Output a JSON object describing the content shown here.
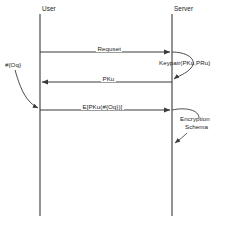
{
  "diagram": {
    "type": "uml-sequence-diagram",
    "title": "",
    "background_color": "#ffffff",
    "line_color": "#3a3a3a",
    "text_color": "#1c1c1c",
    "lifelines": [
      {
        "id": "user",
        "label": "User",
        "x": 40,
        "top": 14,
        "bottom": 216,
        "label_x": 42,
        "label_y": 6
      },
      {
        "id": "server",
        "label": "Server",
        "x": 172,
        "top": 14,
        "bottom": 216,
        "label_x": 174,
        "label_y": 6
      }
    ],
    "messages": [
      {
        "id": "request",
        "label": "Requset",
        "from": "user",
        "to": "server",
        "y": 52,
        "direction": "right",
        "label_x": 97,
        "label_y": 46
      },
      {
        "id": "public-key",
        "label": "PKu",
        "from": "server",
        "to": "user",
        "y": 82,
        "direction": "left",
        "label_x": 100,
        "label_y": 76
      },
      {
        "id": "encrypted-payload",
        "label": "E[PKu(#{Oq})]",
        "from": "user",
        "to": "server",
        "y": 110,
        "direction": "right",
        "label_x": 82,
        "label_y": 104
      }
    ],
    "annotations": [
      {
        "id": "keypair",
        "label": "Keypair(PKu,PRu)",
        "lifeline": "server",
        "label_x": 160,
        "label_y": 60,
        "kind": "self-activation"
      },
      {
        "id": "user-object",
        "label": "#{Oq}",
        "lifeline": "user",
        "label_x": 5,
        "label_y": 62,
        "kind": "self-activation"
      },
      {
        "id": "encryption-schema",
        "label_line1": "Encryption",
        "label_line2": "Schema",
        "lifeline": "server",
        "label_x": 182,
        "label_y": 117,
        "kind": "self-activation"
      }
    ]
  }
}
